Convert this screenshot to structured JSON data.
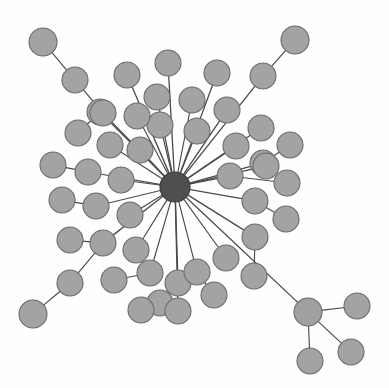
{
  "diagram": {
    "type": "node-link-graph",
    "background_color": "#ffffff",
    "node_fill_color": "#a3a3a3",
    "node_stroke_color": "#6b6b6b",
    "hub_fill_color": "#4f4f4f",
    "edge_color": "#4a4a4a",
    "node_count": 52,
    "edge_count": 51,
    "hub_label": "",
    "nodes": [
      {
        "id": "hub",
        "x": 175,
        "y": 187,
        "r": 15,
        "kind": "hub",
        "label": ""
      },
      {
        "id": "n1",
        "x": 168,
        "y": 63,
        "r": 13,
        "kind": "leaf",
        "label": ""
      },
      {
        "id": "n2",
        "x": 127,
        "y": 75,
        "r": 13,
        "kind": "leaf",
        "label": ""
      },
      {
        "id": "n3",
        "x": 157,
        "y": 97,
        "r": 13,
        "kind": "leaf",
        "label": ""
      },
      {
        "id": "n4",
        "x": 192,
        "y": 100,
        "r": 13,
        "kind": "leaf",
        "label": ""
      },
      {
        "id": "n5",
        "x": 217,
        "y": 73,
        "r": 13,
        "kind": "leaf",
        "label": ""
      },
      {
        "id": "n6",
        "x": 160,
        "y": 125,
        "r": 13,
        "kind": "leaf",
        "label": ""
      },
      {
        "id": "n7",
        "x": 137,
        "y": 116,
        "r": 13,
        "kind": "leaf",
        "label": ""
      },
      {
        "id": "n8",
        "x": 197,
        "y": 131,
        "r": 13,
        "kind": "leaf",
        "label": ""
      },
      {
        "id": "n9",
        "x": 227,
        "y": 110,
        "r": 13,
        "kind": "leaf",
        "label": ""
      },
      {
        "id": "n10",
        "x": 236,
        "y": 146,
        "r": 13,
        "kind": "leaf",
        "label": ""
      },
      {
        "id": "n11",
        "x": 261,
        "y": 128,
        "r": 13,
        "kind": "leaf",
        "label": ""
      },
      {
        "id": "n12",
        "x": 263,
        "y": 163,
        "r": 13,
        "kind": "leaf",
        "label": ""
      },
      {
        "id": "n13",
        "x": 290,
        "y": 145,
        "r": 13,
        "kind": "leaf",
        "label": ""
      },
      {
        "id": "n14",
        "x": 110,
        "y": 145,
        "r": 13,
        "kind": "leaf",
        "label": ""
      },
      {
        "id": "n15",
        "x": 140,
        "y": 150,
        "r": 13,
        "kind": "leaf",
        "label": ""
      },
      {
        "id": "n16",
        "x": 100,
        "y": 112,
        "r": 13,
        "kind": "leaf",
        "label": ""
      },
      {
        "id": "n17",
        "x": 78,
        "y": 133,
        "r": 13,
        "kind": "leaf",
        "label": ""
      },
      {
        "id": "n18",
        "x": 53,
        "y": 165,
        "r": 13,
        "kind": "leaf",
        "label": ""
      },
      {
        "id": "n19",
        "x": 88,
        "y": 172,
        "r": 13,
        "kind": "leaf",
        "label": ""
      },
      {
        "id": "n20",
        "x": 121,
        "y": 180,
        "r": 13,
        "kind": "leaf",
        "label": ""
      },
      {
        "id": "n21",
        "x": 62,
        "y": 200,
        "r": 13,
        "kind": "leaf",
        "label": ""
      },
      {
        "id": "n22",
        "x": 96,
        "y": 206,
        "r": 13,
        "kind": "leaf",
        "label": ""
      },
      {
        "id": "n23",
        "x": 130,
        "y": 215,
        "r": 13,
        "kind": "leaf",
        "label": ""
      },
      {
        "id": "n24",
        "x": 70,
        "y": 240,
        "r": 13,
        "kind": "leaf",
        "label": ""
      },
      {
        "id": "n25",
        "x": 103,
        "y": 243,
        "r": 13,
        "kind": "leaf",
        "label": ""
      },
      {
        "id": "n26",
        "x": 136,
        "y": 250,
        "r": 13,
        "kind": "leaf",
        "label": ""
      },
      {
        "id": "n27",
        "x": 114,
        "y": 280,
        "r": 13,
        "kind": "leaf",
        "label": ""
      },
      {
        "id": "n28",
        "x": 150,
        "y": 273,
        "r": 13,
        "kind": "leaf",
        "label": ""
      },
      {
        "id": "n29",
        "x": 160,
        "y": 303,
        "r": 13,
        "kind": "leaf",
        "label": ""
      },
      {
        "id": "n30",
        "x": 141,
        "y": 310,
        "r": 13,
        "kind": "leaf",
        "label": ""
      },
      {
        "id": "n31",
        "x": 178,
        "y": 283,
        "r": 13,
        "kind": "leaf",
        "label": ""
      },
      {
        "id": "n32",
        "x": 178,
        "y": 311,
        "r": 13,
        "kind": "leaf",
        "label": ""
      },
      {
        "id": "n33",
        "x": 197,
        "y": 272,
        "r": 13,
        "kind": "leaf",
        "label": ""
      },
      {
        "id": "n34",
        "x": 214,
        "y": 295,
        "r": 13,
        "kind": "leaf",
        "label": ""
      },
      {
        "id": "n35",
        "x": 226,
        "y": 258,
        "r": 13,
        "kind": "leaf",
        "label": ""
      },
      {
        "id": "n36",
        "x": 255,
        "y": 237,
        "r": 13,
        "kind": "leaf",
        "label": ""
      },
      {
        "id": "n37",
        "x": 254,
        "y": 276,
        "r": 13,
        "kind": "leaf",
        "label": ""
      },
      {
        "id": "n38",
        "x": 286,
        "y": 219,
        "r": 13,
        "kind": "leaf",
        "label": ""
      },
      {
        "id": "n39",
        "x": 255,
        "y": 201,
        "r": 13,
        "kind": "leaf",
        "label": ""
      },
      {
        "id": "n40",
        "x": 230,
        "y": 176,
        "r": 13,
        "kind": "leaf",
        "label": ""
      },
      {
        "id": "n41",
        "x": 287,
        "y": 183,
        "r": 13,
        "kind": "leaf",
        "label": ""
      },
      {
        "id": "n42",
        "x": 266,
        "y": 166,
        "r": 13,
        "kind": "leaf",
        "label": ""
      },
      {
        "id": "n43",
        "x": 43,
        "y": 42,
        "r": 14,
        "kind": "leaf",
        "label": ""
      },
      {
        "id": "n44",
        "x": 75,
        "y": 80,
        "r": 13,
        "kind": "leaf",
        "label": ""
      },
      {
        "id": "n45",
        "x": 103,
        "y": 113,
        "r": 13,
        "kind": "leaf",
        "label": ""
      },
      {
        "id": "n46",
        "x": 295,
        "y": 40,
        "r": 14,
        "kind": "leaf",
        "label": ""
      },
      {
        "id": "n47",
        "x": 263,
        "y": 76,
        "r": 13,
        "kind": "leaf",
        "label": ""
      },
      {
        "id": "n48",
        "x": 33,
        "y": 314,
        "r": 14,
        "kind": "leaf",
        "label": ""
      },
      {
        "id": "n49",
        "x": 70,
        "y": 283,
        "r": 13,
        "kind": "leaf",
        "label": ""
      },
      {
        "id": "sub",
        "x": 308,
        "y": 312,
        "r": 14,
        "kind": "sub",
        "label": ""
      },
      {
        "id": "s1",
        "x": 357,
        "y": 306,
        "r": 13,
        "kind": "leaf",
        "label": ""
      },
      {
        "id": "s2",
        "x": 351,
        "y": 352,
        "r": 13,
        "kind": "leaf",
        "label": ""
      },
      {
        "id": "s3",
        "x": 310,
        "y": 361,
        "r": 13,
        "kind": "leaf",
        "label": ""
      }
    ],
    "edges": [
      {
        "from": "hub",
        "to": "n1"
      },
      {
        "from": "hub",
        "to": "n2"
      },
      {
        "from": "hub",
        "to": "n3"
      },
      {
        "from": "hub",
        "to": "n4"
      },
      {
        "from": "hub",
        "to": "n5"
      },
      {
        "from": "hub",
        "to": "n6"
      },
      {
        "from": "hub",
        "to": "n7"
      },
      {
        "from": "hub",
        "to": "n8"
      },
      {
        "from": "hub",
        "to": "n9"
      },
      {
        "from": "hub",
        "to": "n10"
      },
      {
        "from": "hub",
        "to": "n11"
      },
      {
        "from": "hub",
        "to": "n12"
      },
      {
        "from": "n12",
        "to": "n13"
      },
      {
        "from": "hub",
        "to": "n14"
      },
      {
        "from": "hub",
        "to": "n15"
      },
      {
        "from": "hub",
        "to": "n16"
      },
      {
        "from": "n16",
        "to": "n17"
      },
      {
        "from": "hub",
        "to": "n19"
      },
      {
        "from": "n19",
        "to": "n18"
      },
      {
        "from": "hub",
        "to": "n20"
      },
      {
        "from": "hub",
        "to": "n22"
      },
      {
        "from": "n22",
        "to": "n21"
      },
      {
        "from": "hub",
        "to": "n23"
      },
      {
        "from": "hub",
        "to": "n25"
      },
      {
        "from": "n25",
        "to": "n24"
      },
      {
        "from": "hub",
        "to": "n26"
      },
      {
        "from": "hub",
        "to": "n28"
      },
      {
        "from": "n28",
        "to": "n27"
      },
      {
        "from": "hub",
        "to": "n31"
      },
      {
        "from": "n31",
        "to": "n29"
      },
      {
        "from": "n31",
        "to": "n30"
      },
      {
        "from": "hub",
        "to": "n32"
      },
      {
        "from": "hub",
        "to": "n33"
      },
      {
        "from": "n33",
        "to": "n34"
      },
      {
        "from": "hub",
        "to": "n35"
      },
      {
        "from": "hub",
        "to": "n36"
      },
      {
        "from": "n36",
        "to": "n37"
      },
      {
        "from": "hub",
        "to": "n39"
      },
      {
        "from": "n39",
        "to": "n38"
      },
      {
        "from": "hub",
        "to": "n40"
      },
      {
        "from": "n40",
        "to": "n41"
      },
      {
        "from": "hub",
        "to": "n42"
      },
      {
        "from": "hub",
        "to": "n45"
      },
      {
        "from": "n45",
        "to": "n44"
      },
      {
        "from": "n44",
        "to": "n43"
      },
      {
        "from": "hub",
        "to": "n47"
      },
      {
        "from": "n47",
        "to": "n46"
      },
      {
        "from": "n25",
        "to": "n49"
      },
      {
        "from": "n49",
        "to": "n48"
      },
      {
        "from": "hub",
        "to": "sub"
      },
      {
        "from": "sub",
        "to": "s1"
      },
      {
        "from": "sub",
        "to": "s2"
      },
      {
        "from": "sub",
        "to": "s3"
      }
    ]
  }
}
